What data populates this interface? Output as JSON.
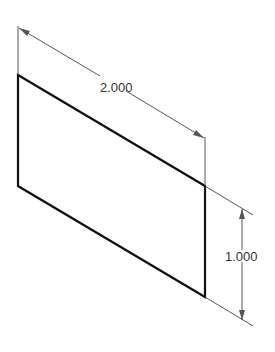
{
  "diagram": {
    "type": "isometric-drawing",
    "shape": "parallelogram-face",
    "colors": {
      "background": "#ffffff",
      "outline": "#111111",
      "dimension": "#333333"
    },
    "dimensions": [
      {
        "id": "width",
        "label": "2.000",
        "orientation": "isometric-diagonal"
      },
      {
        "id": "height",
        "label": "1.000",
        "orientation": "vertical"
      }
    ]
  }
}
